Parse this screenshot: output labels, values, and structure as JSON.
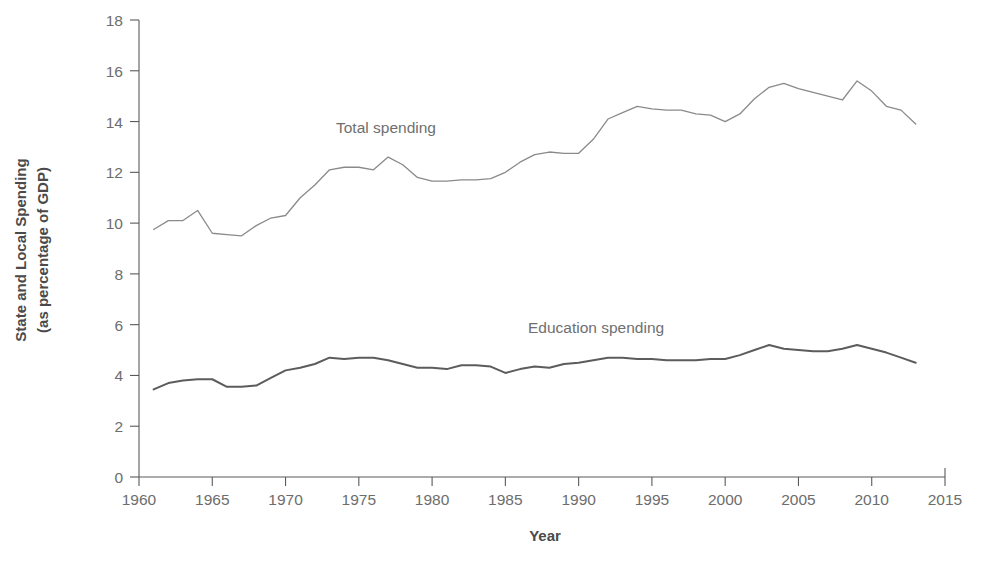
{
  "chart_data": {
    "type": "line",
    "title": "",
    "xlabel": "Year",
    "ylabel": "State and Local Spending (as percentage of GDP)",
    "ylabel_line1": "State and Local Spending",
    "ylabel_line2": "(as percentage of GDP)",
    "xlim": [
      1960,
      2015
    ],
    "ylim": [
      0,
      18
    ],
    "grid": false,
    "legend_position": "inline-annotations",
    "xticks": [
      1960,
      1965,
      1970,
      1975,
      1980,
      1985,
      1990,
      1995,
      2000,
      2005,
      2010,
      2015
    ],
    "xtick_labels": [
      "1960",
      "1965",
      "1970",
      "1975",
      "1980",
      "1985",
      "1990",
      "1995",
      "2000",
      "2005",
      "2010",
      "2015"
    ],
    "yticks": [
      0,
      2,
      4,
      6,
      8,
      10,
      12,
      14,
      16,
      18
    ],
    "ytick_labels": [
      "0",
      "2",
      "4",
      "6",
      "8",
      "10",
      "12",
      "14",
      "16",
      "18"
    ],
    "x": [
      1961,
      1962,
      1963,
      1964,
      1965,
      1966,
      1967,
      1968,
      1969,
      1970,
      1971,
      1972,
      1973,
      1974,
      1975,
      1976,
      1977,
      1978,
      1979,
      1980,
      1981,
      1982,
      1983,
      1984,
      1985,
      1986,
      1987,
      1988,
      1989,
      1990,
      1991,
      1992,
      1993,
      1994,
      1995,
      1996,
      1997,
      1998,
      1999,
      2000,
      2001,
      2002,
      2003,
      2004,
      2005,
      2006,
      2007,
      2008,
      2009,
      2010,
      2011,
      2012,
      2013
    ],
    "series": [
      {
        "name": "Total spending",
        "color": "#8a8a8a",
        "values": [
          9.75,
          10.1,
          10.1,
          10.5,
          9.6,
          9.55,
          9.5,
          9.9,
          10.2,
          10.3,
          11.0,
          11.5,
          12.1,
          12.2,
          12.2,
          12.1,
          12.6,
          12.3,
          11.8,
          11.65,
          11.65,
          11.7,
          11.7,
          11.75,
          12.0,
          12.4,
          12.7,
          12.8,
          12.75,
          12.75,
          13.3,
          14.1,
          14.35,
          14.6,
          14.5,
          14.45,
          14.45,
          14.3,
          14.25,
          14.0,
          14.3,
          14.9,
          15.35,
          15.5,
          15.3,
          15.15,
          15.0,
          14.85,
          15.6,
          15.2,
          14.6,
          14.45,
          13.9
        ]
      },
      {
        "name": "Education spending",
        "color": "#5c5c5c",
        "values": [
          3.45,
          3.7,
          3.8,
          3.85,
          3.85,
          3.55,
          3.55,
          3.6,
          3.9,
          4.2,
          4.3,
          4.45,
          4.7,
          4.65,
          4.7,
          4.7,
          4.6,
          4.45,
          4.3,
          4.3,
          4.25,
          4.4,
          4.4,
          4.35,
          4.1,
          4.25,
          4.35,
          4.3,
          4.45,
          4.5,
          4.6,
          4.7,
          4.7,
          4.65,
          4.65,
          4.6,
          4.6,
          4.6,
          4.65,
          4.65,
          4.8,
          5.0,
          5.2,
          5.05,
          5.0,
          4.95,
          4.95,
          5.05,
          5.2,
          5.05,
          4.9,
          4.7,
          4.5
        ]
      }
    ],
    "annotations": [
      {
        "text": "Total spending",
        "x_px": 336,
        "y_px": 133
      },
      {
        "text": "Education spending",
        "x_px": 528,
        "y_px": 333
      }
    ]
  }
}
